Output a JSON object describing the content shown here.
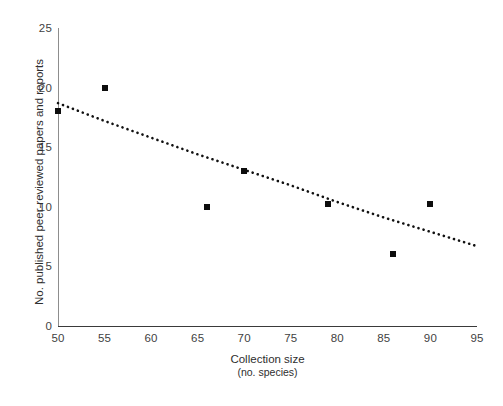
{
  "chart_data": {
    "type": "scatter",
    "title": "",
    "xlabel": "Collection size",
    "xlabel_sub": "(no. species)",
    "ylabel": "No. published peer-reviewed papers and reports",
    "xlim": [
      50,
      95
    ],
    "ylim": [
      0,
      25
    ],
    "xticks": [
      50,
      55,
      60,
      65,
      70,
      75,
      80,
      85,
      90,
      95
    ],
    "yticks": [
      0,
      5,
      10,
      15,
      20,
      25
    ],
    "grid": false,
    "legend": null,
    "marker": "square",
    "marker_color": "#0d0d0d",
    "axis_color": "#8d8d8d",
    "points": [
      {
        "x": 50,
        "y": 18
      },
      {
        "x": 55,
        "y": 20
      },
      {
        "x": 66,
        "y": 10
      },
      {
        "x": 70,
        "y": 13
      },
      {
        "x": 79,
        "y": 10.2
      },
      {
        "x": 86,
        "y": 6
      },
      {
        "x": 90,
        "y": 10.2
      }
    ],
    "trendline": {
      "style": "dotted",
      "color": "#111111",
      "points": [
        {
          "x": 50,
          "y": 18.7
        },
        {
          "x": 55,
          "y": 17.2
        },
        {
          "x": 60,
          "y": 15.8
        },
        {
          "x": 65,
          "y": 14.4
        },
        {
          "x": 70,
          "y": 13.1
        },
        {
          "x": 75,
          "y": 11.8
        },
        {
          "x": 80,
          "y": 10.4
        },
        {
          "x": 85,
          "y": 9.1
        },
        {
          "x": 90,
          "y": 7.9
        },
        {
          "x": 95,
          "y": 6.7
        }
      ]
    }
  }
}
